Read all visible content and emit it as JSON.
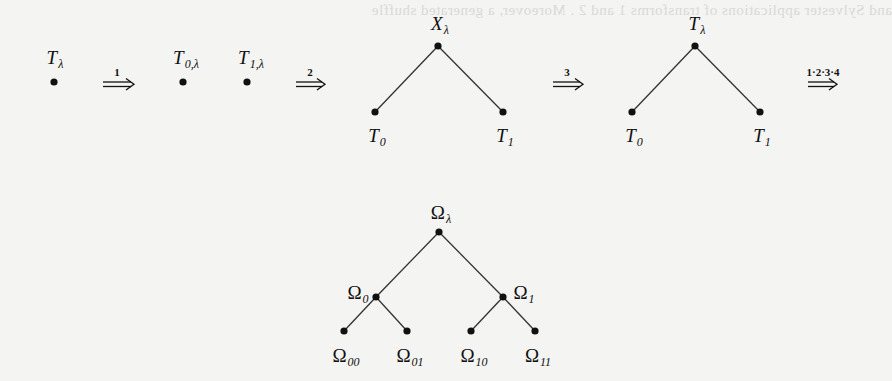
{
  "bleed_through_text": "and Sylvester applications of transforms 1 and 2 . Moreover, a generated shuffle",
  "row1": {
    "step0": {
      "label_base": "T",
      "label_sub": "λ"
    },
    "arrow1": {
      "label": "1"
    },
    "step1": {
      "left": {
        "label_base": "T",
        "label_sub": "0,λ"
      },
      "right": {
        "label_base": "T",
        "label_sub": "1,λ"
      }
    },
    "arrow2": {
      "label": "2"
    },
    "step2": {
      "root": {
        "label_base": "X",
        "label_sub": "λ"
      },
      "left": {
        "label_base": "T",
        "label_sub": "0"
      },
      "right": {
        "label_base": "T",
        "label_sub": "1"
      }
    },
    "arrow3": {
      "label": "3"
    },
    "step3": {
      "root": {
        "label_base": "T",
        "label_sub": "λ"
      },
      "left": {
        "label_base": "T",
        "label_sub": "0"
      },
      "right": {
        "label_base": "T",
        "label_sub": "1"
      }
    },
    "arrow4": {
      "label": "1·2·3·4"
    }
  },
  "omega_tree": {
    "root": {
      "label_base": "Ω",
      "label_sub": "λ"
    },
    "level1": [
      {
        "label_base": "Ω",
        "label_sub": "0"
      },
      {
        "label_base": "Ω",
        "label_sub": "1"
      }
    ],
    "level2": [
      {
        "label_base": "Ω",
        "label_sub": "00"
      },
      {
        "label_base": "Ω",
        "label_sub": "01"
      },
      {
        "label_base": "Ω",
        "label_sub": "10"
      },
      {
        "label_base": "Ω",
        "label_sub": "11"
      }
    ]
  },
  "colors": {
    "ink": "#111111",
    "paper": "#f4f4f2",
    "edge": "#333333"
  }
}
